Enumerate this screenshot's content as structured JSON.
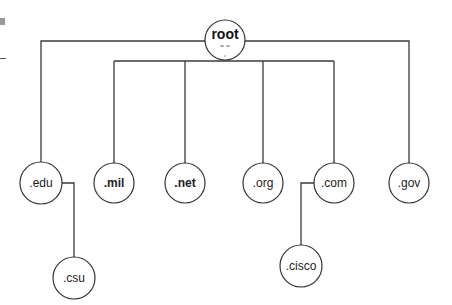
{
  "diagram": {
    "type": "tree",
    "root": {
      "label": "root",
      "sublabel": "\" \""
    },
    "tld_nodes": [
      {
        "id": "edu",
        "label": ".edu",
        "bold": false
      },
      {
        "id": "mil",
        "label": ".mil",
        "bold": true
      },
      {
        "id": "net",
        "label": ".net",
        "bold": true
      },
      {
        "id": "org",
        "label": ".org",
        "bold": false
      },
      {
        "id": "com",
        "label": ".com",
        "bold": false
      },
      {
        "id": "gov",
        "label": ".gov",
        "bold": false
      }
    ],
    "second_level_nodes": [
      {
        "id": "csu",
        "label": ".csu",
        "parent": "edu"
      },
      {
        "id": "cisco",
        "label": ".cisco",
        "parent": "com"
      }
    ],
    "edges": [
      [
        "root",
        "edu"
      ],
      [
        "root",
        "mil"
      ],
      [
        "root",
        "net"
      ],
      [
        "root",
        "org"
      ],
      [
        "root",
        "com"
      ],
      [
        "root",
        "gov"
      ],
      [
        "edu",
        "csu"
      ],
      [
        "com",
        "cisco"
      ]
    ],
    "colors": {
      "line": "#3a3a3a",
      "node_fill": "#ffffff",
      "node_stroke": "#333333",
      "text": "#222222"
    }
  }
}
